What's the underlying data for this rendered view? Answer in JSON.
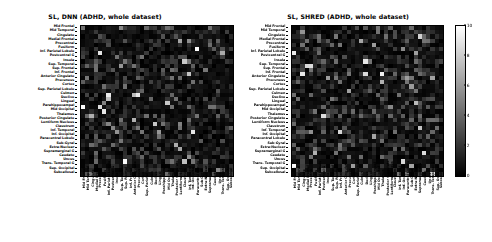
{
  "figure": {
    "background_color": "#ffffff",
    "text_color": "#000000"
  },
  "panels": [
    {
      "id": "left",
      "title": "SL, DNN (ADHD, whole dataset)"
    },
    {
      "id": "right",
      "title": "SL, SHRED (ADHD, whole dataset)"
    }
  ],
  "colorbar": {
    "label": "",
    "vmin": 0,
    "vmax": 10,
    "colormap": "gray",
    "low_color": "#000000",
    "high_color": "#ffffff",
    "ticks": [
      0,
      2,
      4,
      6,
      8,
      10
    ],
    "tick_labels": [
      "0",
      "2",
      "4",
      "6",
      "8",
      "10"
    ]
  },
  "chart_data": {
    "type": "heatmap",
    "xlabel": "",
    "ylabel": "",
    "grid": false,
    "legend_position": "right",
    "colormap": "gray",
    "zlim": [
      0,
      10
    ],
    "categories": [
      "Mid Frontal",
      "Mid Temporal",
      "Cingulate",
      "Medial Frontal",
      "Precentral",
      "Fusiform",
      "Inf. Parietal Lobule",
      "Postcentral G",
      "Insula",
      "Sup. Temporal",
      "Sup. Frontal",
      "Inf. Frontal",
      "Anterior Cingulate",
      "Precuneus",
      "Cortex",
      "Sup. Parietal Lobule",
      "Culmen",
      "Declive",
      "Lingual",
      "Parahippocampal",
      "Mid Occipital",
      "Thalamus",
      "Posterior Cingulate",
      "Lentiform Nucleus",
      "Claustrum",
      "Inf. Temporal",
      "Inf. Occipital",
      "Paracentral Lobule",
      "Sub-Gyral",
      "Extra-Nuclear",
      "Supramarginal G",
      "Caudate",
      "Uncus",
      "Trans. Temporal G",
      "Sup. Occipital",
      "Subcallosal"
    ],
    "x": [
      "Mid Frontal",
      "Mid Temporal",
      "Cingulate",
      "Medial Frontal",
      "Precentral",
      "Fusiform",
      "Inf. Parietal Lobule",
      "Postcentral G",
      "Insula",
      "Sup. Temporal",
      "Sup. Frontal",
      "Inf. Frontal",
      "Anterior Cingulate",
      "Precuneus",
      "Cortex",
      "Sup. Parietal Lobule",
      "Culmen",
      "Declive",
      "Lingual",
      "Parahippocampal",
      "Mid Occipital",
      "Thalamus",
      "Posterior Cingulate",
      "Lentiform Nucleus",
      "Claustrum",
      "Inf. Temporal",
      "Inf. Occipital",
      "Paracentral Lobule",
      "Sub-Gyral",
      "Extra-Nuclear",
      "Supramarginal G",
      "Caudate",
      "Uncus",
      "Trans. Temporal G",
      "Sup. Occipital",
      "Subcallosal"
    ],
    "y": [
      "Mid Frontal",
      "Mid Temporal",
      "Cingulate",
      "Medial Frontal",
      "Precentral",
      "Fusiform",
      "Inf. Parietal Lobule",
      "Postcentral G",
      "Insula",
      "Sup. Temporal",
      "Sup. Frontal",
      "Inf. Frontal",
      "Anterior Cingulate",
      "Precuneus",
      "Cortex",
      "Sup. Parietal Lobule",
      "Culmen",
      "Declive",
      "Lingual",
      "Parahippocampal",
      "Mid Occipital",
      "Thalamus",
      "Posterior Cingulate",
      "Lentiform Nucleus",
      "Claustrum",
      "Inf. Temporal",
      "Inf. Occipital",
      "Paracentral Lobule",
      "Sub-Gyral",
      "Extra-Nuclear",
      "Supramarginal G",
      "Caudate",
      "Uncus",
      "Trans. Temporal G",
      "Sup. Occipital",
      "Subcallosal"
    ],
    "series": [
      {
        "name": "SL, DNN (ADHD, whole dataset)",
        "n_rows": 36,
        "n_cols": 36,
        "value_range": [
          0,
          10
        ],
        "typical_value": 1.2,
        "description": "Sparse saliency matrix; mostly near-zero (dark) entries with scattered bright cells reaching ~8-10."
      },
      {
        "name": "SL, SHRED (ADHD, whole dataset)",
        "n_rows": 36,
        "n_cols": 36,
        "value_range": [
          0,
          10
        ],
        "typical_value": 1.1,
        "description": "Sparse saliency matrix; mostly near-zero (dark) entries with scattered bright cells reaching ~9-10."
      }
    ]
  }
}
